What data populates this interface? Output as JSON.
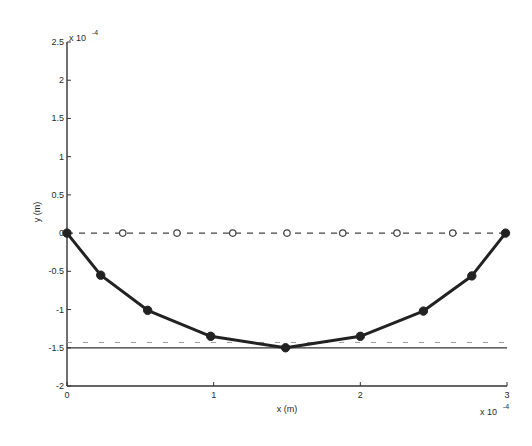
{
  "chart_data": {
    "type": "line",
    "title": "",
    "xlabel": "x (m)",
    "ylabel": "y (m)",
    "x_multiplier_label": "x 10",
    "x_multiplier_exp": "-4",
    "y_multiplier_label": "x 10",
    "y_multiplier_exp": "-4",
    "xlim": [
      0,
      3
    ],
    "ylim": [
      -2,
      2.5
    ],
    "xticks": [
      0,
      1,
      2,
      3
    ],
    "xtick_labels": [
      "0",
      "1",
      "2",
      "3"
    ],
    "yticks": [
      -2,
      -1.5,
      -1,
      -0.5,
      0,
      0.5,
      1,
      1.5,
      2,
      2.5
    ],
    "ytick_labels": [
      "-2",
      "-1.5",
      "-1",
      "-0.5",
      "0",
      "0.5",
      "1",
      "1.5",
      "2",
      "2.5"
    ],
    "grid": false,
    "legend": null,
    "units_scale": "1e-4",
    "series": [
      {
        "name": "deformed shape",
        "style": "solid-thick",
        "marker": "filled-circle",
        "color": "#222222",
        "x": [
          0,
          0.23,
          0.55,
          0.98,
          1.49,
          2.0,
          2.43,
          2.76,
          2.99
        ],
        "y": [
          0,
          -0.55,
          -1.01,
          -1.35,
          -1.5,
          -1.35,
          -1.02,
          -0.56,
          0
        ]
      },
      {
        "name": "initial shape",
        "style": "dashed",
        "marker": "open-circle",
        "color": "#444444",
        "x": [
          0,
          0.38,
          0.75,
          1.13,
          1.5,
          1.88,
          2.25,
          2.63,
          2.99
        ],
        "y": [
          0,
          0,
          0,
          0,
          0,
          0,
          0,
          0,
          0
        ]
      },
      {
        "name": "reference line (solid)",
        "style": "solid-thin",
        "marker": "none",
        "color": "#333333",
        "x": [
          0,
          3
        ],
        "y": [
          -1.5,
          -1.5
        ]
      },
      {
        "name": "reference line (dashed)",
        "style": "dashed-light",
        "marker": "none",
        "color": "#9a9a9a",
        "x": [
          0,
          3
        ],
        "y": [
          -1.43,
          -1.43
        ]
      }
    ]
  }
}
